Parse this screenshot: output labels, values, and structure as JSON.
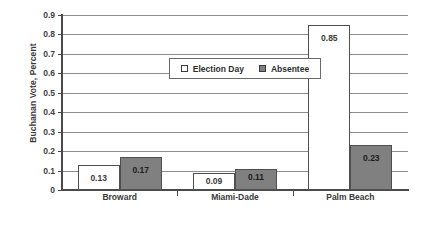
{
  "chart_data": {
    "type": "bar",
    "title": "",
    "subtitle": "",
    "xlabel": "",
    "ylabel": "Buchanan Vote, Percent",
    "categories": [
      "Broward",
      "Miami-Dade",
      "Palm Beach"
    ],
    "series": [
      {
        "name": "Election Day",
        "values": [
          0.13,
          0.09,
          0.85
        ],
        "labels": [
          "0.13",
          "0.09",
          "0.85"
        ],
        "swatch": "hollow-square",
        "color": "#ffffff"
      },
      {
        "name": "Absentee",
        "values": [
          0.17,
          0.11,
          0.23
        ],
        "labels": [
          "0.17",
          "0.11",
          "0.23"
        ],
        "swatch": "filled-square",
        "color": "#808080"
      }
    ],
    "ylim": [
      0,
      0.9
    ],
    "yticks": [
      0,
      0.1,
      0.2,
      0.3,
      0.4,
      0.5,
      0.6,
      0.7,
      0.8,
      0.9
    ],
    "ytick_labels": [
      "0",
      "0.1",
      "0.2",
      "0.3",
      "0.4",
      "0.5",
      "0.6",
      "0.7",
      "0.8",
      "0.9"
    ],
    "grid": true,
    "grid_axis": "y",
    "legend_position": "upper-left-inside",
    "legend_entries": [
      "Election Day",
      "Absentee"
    ]
  }
}
